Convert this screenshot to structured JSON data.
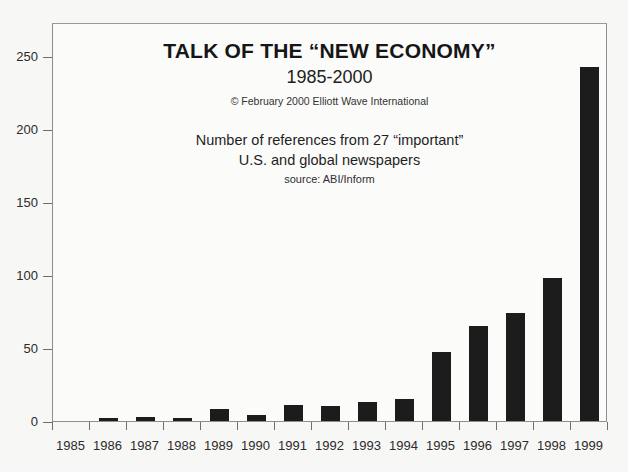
{
  "chart_data": {
    "type": "bar",
    "title": "TALK OF THE “NEW ECONOMY”",
    "subtitle": "1985-2000",
    "copyright": "© February 2000 Elliott Wave International",
    "description_lines": [
      "Number of references from 27 “important”",
      "U.S. and global newspapers"
    ],
    "source": "source: ABI/Inform",
    "categories": [
      "1985",
      "1986",
      "1987",
      "1988",
      "1989",
      "1990",
      "1991",
      "1992",
      "1993",
      "1994",
      "1995",
      "1996",
      "1997",
      "1998",
      "1999"
    ],
    "values": [
      0,
      2,
      3,
      2,
      8,
      4,
      11,
      10,
      13,
      15,
      47,
      65,
      74,
      98,
      242
    ],
    "xlabel": "",
    "ylabel": "",
    "ylim": [
      0,
      273
    ],
    "yticks": [
      0,
      50,
      100,
      150,
      200,
      250
    ],
    "ytick_labels": [
      "0",
      "50",
      "100",
      "150",
      "200",
      "250"
    ],
    "grid": false,
    "legend": "none",
    "bar_color": "#1c1c1c",
    "axis_color": "#6f6f6f",
    "background_color": "#f7f7f5"
  }
}
